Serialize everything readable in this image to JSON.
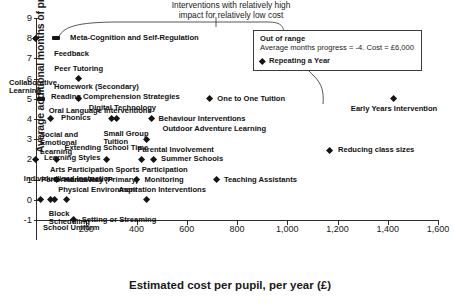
{
  "chart_data": {
    "type": "scatter",
    "title": "",
    "xlabel": "Estimated cost per pupil, per year (£)",
    "ylabel": "Average additional months of progress achieved",
    "xlim": [
      0,
      1600
    ],
    "ylim": [
      -1,
      9
    ],
    "xticks": [
      0,
      200,
      400,
      600,
      800,
      1000,
      1200,
      1400,
      1600
    ],
    "xticklabels": [
      "",
      "200",
      "400",
      "600",
      "800",
      "1,000",
      "1,200",
      "1,400",
      "1,600"
    ],
    "yticks": [
      -1,
      0,
      1,
      2,
      3,
      4,
      5,
      6,
      7,
      8,
      9
    ],
    "yticklabels": [
      "-1",
      "0",
      "1",
      "2",
      "3",
      "4",
      "5",
      "6",
      "7",
      "8",
      "9"
    ],
    "grid": false,
    "legend": "none",
    "points": [
      {
        "label": "Feedback",
        "x": 0,
        "y": 8,
        "lx": 18,
        "ly": 16,
        "align": "left",
        "marker": "diamond"
      },
      {
        "label": "Meta-Cognition and Self-Regulation",
        "x": 80,
        "y": 8,
        "lx": 14,
        "ly": 0,
        "align": "right",
        "marker": "wide"
      },
      {
        "label": "Peer Tutoring",
        "x": 170,
        "y": 6,
        "lx": 0,
        "ly": -10,
        "align": "center",
        "marker": "diamond"
      },
      {
        "label": "Collaborative Learning",
        "x": 155,
        "y": 6,
        "lx": -66,
        "ly": 0,
        "align": "left",
        "marker": "none"
      },
      {
        "label": "Homework (Secondary)",
        "x": 0,
        "y": 5,
        "lx": 18,
        "ly": -12,
        "align": "left",
        "marker": "none"
      },
      {
        "label": "Reading Comprehension Strategies",
        "x": 20,
        "y": 5,
        "lx": 10,
        "ly": -2,
        "align": "left",
        "marker": "wide"
      },
      {
        "label": "Oral Language Interventions",
        "x": 170,
        "y": 5,
        "lx": -30,
        "ly": 12,
        "align": "left",
        "marker": "diamond"
      },
      {
        "label": "One to One Tuition",
        "x": 690,
        "y": 5,
        "lx": 8,
        "ly": 0,
        "align": "right",
        "marker": "diamond"
      },
      {
        "label": "Phonics",
        "x": 60,
        "y": 4,
        "lx": 10,
        "ly": -1,
        "align": "right",
        "marker": "diamond"
      },
      {
        "label": "Social and Emotional Learning",
        "x": 48,
        "y": 4,
        "lx": -8,
        "ly": 12,
        "align": "left",
        "marker": "none"
      },
      {
        "label": "Digital Technology",
        "x": 320,
        "y": 4,
        "lx": 6,
        "ly": -11,
        "align": "center",
        "marker": "diamond"
      },
      {
        "label": "Small Group Tuition",
        "x": 300,
        "y": 4,
        "lx": -8,
        "ly": 11,
        "align": "left",
        "marker": "diamond"
      },
      {
        "label": "Behaviour Interventions",
        "x": 460,
        "y": 4,
        "lx": 7,
        "ly": 0,
        "align": "right",
        "marker": "diamond"
      },
      {
        "label": "Outdoor Adventure Learning",
        "x": 440,
        "y": 3,
        "lx": 16,
        "ly": -10,
        "align": "left",
        "marker": "diamond"
      },
      {
        "label": "Parental Involvement",
        "x": 420,
        "y": 3,
        "lx": -4,
        "ly": 11,
        "align": "left",
        "marker": "none"
      },
      {
        "label": "Learning Styles",
        "x": 0,
        "y": 2,
        "lx": 8,
        "ly": -1,
        "align": "right",
        "marker": "diamond"
      },
      {
        "label": "Arts Participation",
        "x": 80,
        "y": 2,
        "lx": -6,
        "ly": 11,
        "align": "left",
        "marker": "diamond"
      },
      {
        "label": "Extending School Time",
        "x": 280,
        "y": 2,
        "lx": 0,
        "ly": -11,
        "align": "center",
        "marker": "diamond"
      },
      {
        "label": "Summer Schools",
        "x": 470,
        "y": 2,
        "lx": 7,
        "ly": 0,
        "align": "right",
        "marker": "diamond"
      },
      {
        "label": "Sports Participation",
        "x": 420,
        "y": 2,
        "lx": -26,
        "ly": 11,
        "align": "left",
        "marker": "diamond"
      },
      {
        "label": "Individualised Instuction",
        "x": 230,
        "y": 2,
        "lx": -70,
        "ly": 20,
        "align": "left",
        "marker": "none"
      },
      {
        "label": "Homework (Primary)",
        "x": 80,
        "y": 1,
        "lx": 8,
        "ly": 0,
        "align": "right",
        "marker": "diamond"
      },
      {
        "label": "Monitoring",
        "x": 400,
        "y": 1,
        "lx": 8,
        "ly": 0,
        "align": "right",
        "marker": "diamond"
      },
      {
        "label": "Teaching Assistants",
        "x": 720,
        "y": 1,
        "lx": 7,
        "ly": 0,
        "align": "right",
        "marker": "diamond"
      },
      {
        "label": "Performance Pay",
        "x": 60,
        "y": 0,
        "lx": -10,
        "ly": -20,
        "align": "left",
        "marker": "diamond"
      },
      {
        "label": "Physical Environment",
        "x": 120,
        "y": 0,
        "lx": -8,
        "ly": -10,
        "align": "left",
        "marker": "diamond"
      },
      {
        "label": "Aspiration Interventions",
        "x": 440,
        "y": 0,
        "lx": -28,
        "ly": -10,
        "align": "left",
        "marker": "diamond"
      },
      {
        "label": "Block Scheduling",
        "x": 75,
        "y": 0,
        "lx": -6,
        "ly": 10,
        "align": "left",
        "marker": "diamond"
      },
      {
        "label": "School Uniform",
        "x": 20,
        "y": 0,
        "lx": 2,
        "ly": 28,
        "align": "left",
        "marker": "diamond"
      },
      {
        "label": "Setting or Streaming",
        "x": 150,
        "y": -1,
        "lx": 8,
        "ly": 0,
        "align": "right",
        "marker": "diamond"
      },
      {
        "label": "Reducing class sizes",
        "x": 1170,
        "y": 2.45,
        "lx": 8,
        "ly": 0,
        "align": "right",
        "marker": "diamond"
      },
      {
        "label": "Early Years Intervention",
        "x": 1425,
        "y": 5,
        "lx": 0,
        "ly": 10,
        "align": "center",
        "marker": "diamond"
      }
    ],
    "annotation": {
      "line1": "Interventions with relatively high",
      "line2": "impact for relatively low cost"
    },
    "out_of_range": {
      "heading": "Out of range",
      "detail": "Average months progress = -4. Cost = £6,000",
      "item": "Repeating a Year"
    }
  }
}
